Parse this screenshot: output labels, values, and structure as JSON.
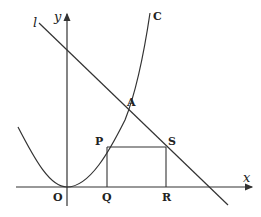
{
  "diagram": {
    "type": "coordinate-geometry",
    "axes": {
      "x_label": "x",
      "y_label": "y",
      "origin_label": "O"
    },
    "curve": {
      "label": "C",
      "kind": "parabola"
    },
    "line": {
      "label": "l"
    },
    "points": {
      "A": "A",
      "P": "P",
      "Q": "Q",
      "R": "R",
      "S": "S"
    },
    "colors": {
      "stroke": "#333333",
      "background": "#ffffff"
    }
  }
}
